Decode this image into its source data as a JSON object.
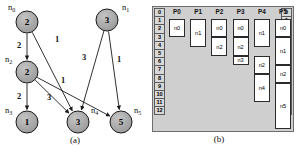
{
  "figure": {
    "caption_a": "(a)",
    "caption_b": "(b)"
  },
  "panel_a": {
    "title": "(a)",
    "description": "Weighted directed task graph",
    "node_shape": "circle",
    "node_fill": "#a8a8a8",
    "node_stroke": "#1a1a1a",
    "nodes": [
      {
        "id": "n0",
        "label": "n0",
        "weight": "2",
        "cx": 27,
        "cy": 22,
        "r": 11,
        "label_x": 8,
        "label_y": 10
      },
      {
        "id": "n1",
        "label": "n1",
        "weight": "3",
        "cx": 107,
        "cy": 20,
        "r": 11,
        "label_x": 122,
        "label_y": 10
      },
      {
        "id": "n2",
        "label": "n2",
        "weight": "2",
        "cx": 27,
        "cy": 72,
        "r": 11,
        "label_x": 5,
        "label_y": 62
      },
      {
        "id": "n3",
        "label": "n3",
        "weight": "1",
        "cx": 27,
        "cy": 122,
        "r": 11,
        "label_x": 5,
        "label_y": 113
      },
      {
        "id": "n4",
        "label": "n4",
        "weight": "3",
        "cx": 78,
        "cy": 122,
        "r": 11,
        "label_x": 91,
        "label_y": 113
      },
      {
        "id": "n5",
        "label": "n5",
        "weight": "5",
        "cx": 121,
        "cy": 122,
        "r": 11,
        "label_x": 134,
        "label_y": 113
      }
    ],
    "edges": [
      {
        "from": "n0",
        "to": "n2",
        "weight": "2",
        "lx": 19,
        "ly": 48
      },
      {
        "from": "n0",
        "to": "n4",
        "weight": "1",
        "lx": 57,
        "ly": 42
      },
      {
        "from": "n2",
        "to": "n3",
        "weight": "2",
        "lx": 19,
        "ly": 99
      },
      {
        "from": "n2",
        "to": "n4",
        "weight": "3",
        "lx": 49,
        "ly": 100
      },
      {
        "from": "n2",
        "to": "n5",
        "weight": "1",
        "lx": 63,
        "ly": 83
      },
      {
        "from": "n1",
        "to": "n4",
        "weight": "3",
        "lx": 84,
        "ly": 60
      },
      {
        "from": "n1",
        "to": "n5",
        "weight": "1",
        "lx": 119,
        "ly": 62
      }
    ]
  },
  "panel_b": {
    "title": "(b)",
    "description": "Processor schedule / Gantt chart",
    "time_scale": [
      "0",
      "1",
      "2",
      "3",
      "4",
      "5",
      "6",
      "7",
      "8",
      "9",
      "10",
      "11",
      "12"
    ],
    "processors": [
      {
        "label": "P0",
        "tasks": [
          {
            "label": "n0",
            "start": 0,
            "end": 2
          }
        ]
      },
      {
        "label": "P1",
        "tasks": [
          {
            "label": "n1",
            "start": 0,
            "end": 3
          }
        ]
      },
      {
        "label": "P2",
        "tasks": [
          {
            "label": "n0",
            "start": 0,
            "end": 2
          },
          {
            "label": "n2",
            "start": 2,
            "end": 4
          }
        ]
      },
      {
        "label": "P3",
        "tasks": [
          {
            "label": "n0",
            "start": 0,
            "end": 2
          },
          {
            "label": "n2",
            "start": 2,
            "end": 4
          },
          {
            "label": "n3",
            "start": 4,
            "end": 5
          }
        ]
      },
      {
        "label": "P4",
        "tasks": [
          {
            "label": "n1",
            "start": 0,
            "end": 3
          },
          {
            "label": "n2",
            "start": 4,
            "end": 6
          },
          {
            "label": "n4",
            "start": 6,
            "end": 9
          }
        ]
      },
      {
        "label": "P5",
        "tasks": [
          {
            "label": "n0",
            "start": 0,
            "end": 2
          },
          {
            "label": "n1",
            "start": 2,
            "end": 5
          },
          {
            "label": "n2",
            "start": 5,
            "end": 7
          },
          {
            "label": "n5",
            "start": 7,
            "end": 12
          }
        ]
      }
    ]
  }
}
